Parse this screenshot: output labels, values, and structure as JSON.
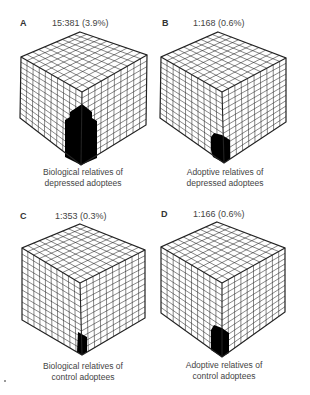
{
  "figure": {
    "panels": [
      {
        "letter": "A",
        "ratio": "15:381 (3.9%)",
        "caption_line1": "Biological relatives of",
        "caption_line2": "depressed adoptees"
      },
      {
        "letter": "B",
        "ratio": "1:168 (0.6%)",
        "caption_line1": "Adoptive relatives of",
        "caption_line2": "depressed adoptees"
      },
      {
        "letter": "C",
        "ratio": "1:353 (0.3%)",
        "caption_line1": "Biological relatives of",
        "caption_line2": "control adoptees"
      },
      {
        "letter": "D",
        "ratio": "1:166 (0.6%)",
        "caption_line1": "Adoptive relatives of",
        "caption_line2": "control adoptees"
      }
    ]
  },
  "colors": {
    "line": "#222222",
    "fill_affected": "#000000",
    "background": "#ffffff"
  }
}
